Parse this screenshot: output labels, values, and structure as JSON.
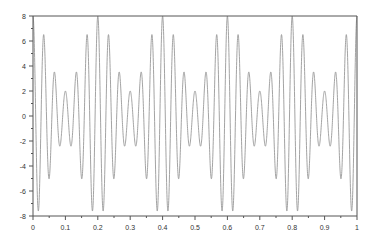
{
  "chart_data": {
    "type": "line",
    "title": "",
    "xlabel": "",
    "ylabel": "",
    "xlim": [
      0,
      1
    ],
    "ylim": [
      -8,
      8
    ],
    "grid": false,
    "legend": null,
    "x_ticks": [
      "0",
      "0.1",
      "0.2",
      "0.3",
      "0.4",
      "0.5",
      "0.6",
      "0.7",
      "0.8",
      "0.9",
      "1"
    ],
    "y_ticks": [
      "8",
      "6",
      "4",
      "2",
      "0",
      "-2",
      "-4",
      "-6",
      "-8"
    ],
    "series": [
      {
        "name": "signal",
        "color": "#999999",
        "description": "AM-modulated 30 Hz cosine with 5 Hz envelope: y = (5 + 3cos(2π·5t))·cos(2π·30t)",
        "carrier_hz": 30,
        "envelope_hz": 5,
        "offset": 5,
        "mod_amplitude": 3,
        "peaks_per_0.2s": [
          8,
          6.5,
          3.5,
          2,
          3.5,
          6.5,
          8
        ],
        "troughs_per_0.2s": [
          -7.6,
          -5,
          -2.4,
          -2.4,
          -5,
          -7.6
        ]
      }
    ]
  },
  "colors": {
    "axis": "#555555",
    "line": "#999999",
    "label": "#333333"
  }
}
